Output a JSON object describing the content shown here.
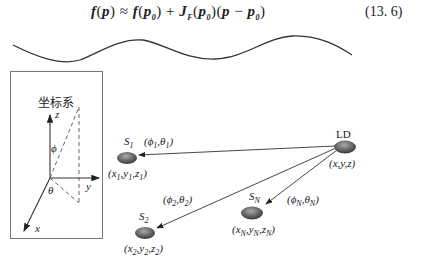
{
  "equation": {
    "lhs": "f(p)",
    "rel": "≈",
    "rhs": "f(p₀) + J_F(p₀)(p − p₀)",
    "number": "(13. 6)"
  },
  "coordinate_box": {
    "title": "坐标系",
    "axes": {
      "z": "z",
      "y": "y",
      "x": "x"
    },
    "angles": {
      "phi": "ϕ",
      "theta": "θ"
    }
  },
  "nodes": [
    {
      "id": "LD",
      "label": "LD",
      "coords": "(x,y,z)"
    },
    {
      "id": "S1",
      "label": "S1",
      "coords": "(x1,y1,z1)",
      "angle": "(ϕ1,θ1)"
    },
    {
      "id": "S2",
      "label": "S2",
      "coords": "(x2,y2,z2)",
      "angle": "(ϕ2,θ2)"
    },
    {
      "id": "SN",
      "label": "SN",
      "coords": "(xN,yN,zN)",
      "angle": "(ϕN,θN)"
    }
  ],
  "colors": {
    "line": "#333333",
    "node_dark": "#555555",
    "node_light": "#aaaaaa"
  }
}
